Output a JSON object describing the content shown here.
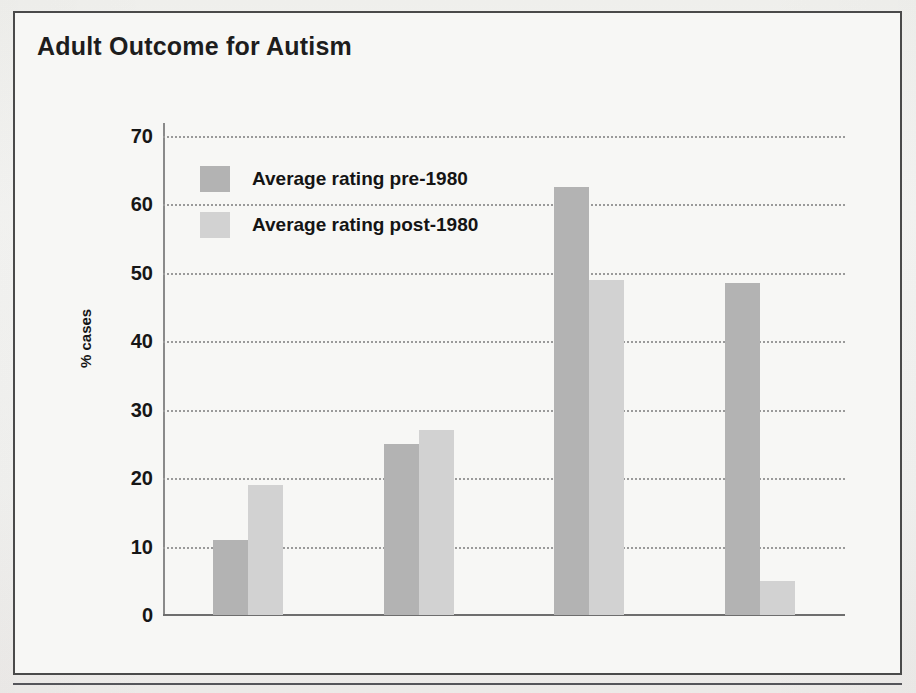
{
  "figure": {
    "title": "Adult Outcome for Autism"
  },
  "chart_data": {
    "type": "bar",
    "title": "Adult Outcome for Autism",
    "xlabel": "",
    "ylabel": "% cases",
    "ylim": [
      0,
      70
    ],
    "yticks": [
      0,
      10,
      20,
      30,
      40,
      50,
      60,
      70
    ],
    "ytick_labels": [
      "0",
      "10",
      "20",
      "30",
      "40",
      "50",
      "60",
      "70"
    ],
    "grid": true,
    "legend_position": "upper-left-inside",
    "categories": [
      "Good outcome",
      "Fair outcome",
      "Poor outcome",
      "In hospital care"
    ],
    "category_lines": [
      [
        "Good",
        "outcome"
      ],
      [
        "Fair",
        "outcome"
      ],
      [
        "Poor",
        "outcome"
      ],
      [
        "In hospital",
        "care"
      ]
    ],
    "series": [
      {
        "name": "Average rating pre-1980",
        "color": "#b3b3b3",
        "values": [
          11,
          25,
          62.5,
          48.5
        ]
      },
      {
        "name": "Average rating post-1980",
        "color": "#d2d2d2",
        "values": [
          19,
          27,
          49,
          5
        ]
      }
    ]
  },
  "colors": {
    "series_pre": "#b3b3b3",
    "series_post": "#d2d2d2",
    "frame": "#4a4a4a",
    "gridline": "#9a9a9a",
    "axis": "#6e6e6e",
    "text": "#141414",
    "background": "#f7f7f5"
  }
}
